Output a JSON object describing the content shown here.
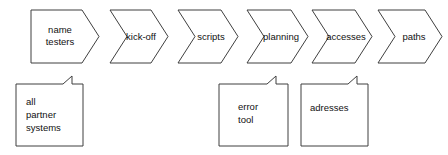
{
  "diagram": {
    "type": "process-flow",
    "background_color": "#ffffff",
    "line_color": "#3f3f3f",
    "text_color": "#111111",
    "process_steps": [
      {
        "id": "step-1",
        "shape": "pentagon-arrow",
        "lines": [
          "name",
          "testers"
        ],
        "label": "name testers"
      },
      {
        "id": "step-2",
        "shape": "chevron",
        "lines": [
          "kick-off"
        ],
        "label": "kick-off"
      },
      {
        "id": "step-3",
        "shape": "chevron",
        "lines": [
          "scripts"
        ],
        "label": "scripts"
      },
      {
        "id": "step-4",
        "shape": "chevron",
        "lines": [
          "planning"
        ],
        "label": "planning"
      },
      {
        "id": "step-5",
        "shape": "chevron",
        "lines": [
          "accesses"
        ],
        "label": "accesses"
      },
      {
        "id": "step-6",
        "shape": "chevron",
        "lines": [
          "paths"
        ],
        "label": "paths"
      }
    ],
    "notes": [
      {
        "id": "note-1",
        "shape": "folded-corner-note",
        "lines": [
          "all",
          "partner",
          "systems"
        ],
        "label": "all partner systems"
      },
      {
        "id": "note-2",
        "shape": "folded-corner-note",
        "lines": [
          "error",
          "tool"
        ],
        "label": "error tool"
      },
      {
        "id": "note-3",
        "shape": "folded-corner-note",
        "lines": [
          "adresses"
        ],
        "label": "adresses"
      }
    ]
  }
}
